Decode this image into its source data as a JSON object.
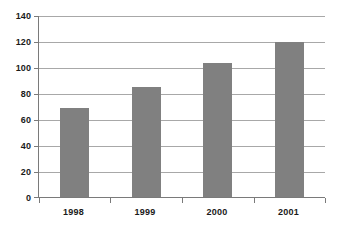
{
  "chart_data": {
    "type": "bar",
    "title": "",
    "subtitle": "",
    "xlabel": "",
    "ylabel": "",
    "categories": [
      "1998",
      "1999",
      "2000",
      "2001"
    ],
    "values": [
      69,
      85,
      104,
      120
    ],
    "series": [
      {
        "name": "Series 1",
        "values": [
          69,
          85,
          104,
          120
        ]
      }
    ],
    "ylim": [
      0,
      140
    ],
    "ytick_step": 20,
    "ytick_labels": [
      "0",
      "20",
      "40",
      "60",
      "80",
      "100",
      "120",
      "140"
    ],
    "ytick_values": [
      0,
      20,
      40,
      60,
      80,
      100,
      120,
      140
    ],
    "grid": true,
    "grid_axis": "y",
    "legend": false,
    "legend_position": "none",
    "bar_color": "#808080",
    "gridline_color": "#a8a8a8",
    "axis_color": "#7a7a7a",
    "background_color": "#ffffff",
    "text_color": "#1a1a1a"
  }
}
